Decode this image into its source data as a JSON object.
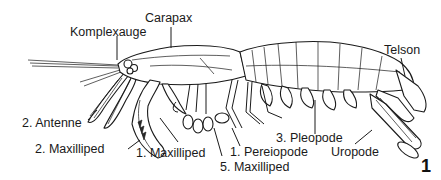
{
  "diagram": {
    "figure_number": "1",
    "labels": {
      "carapax": "Carapax",
      "komplexauge": "Komplexauge",
      "telson": "Telson",
      "antenne2": "2. Antenne",
      "maxilliped2": "2. Maxilliped",
      "maxilliped1": "1. Maxilliped",
      "maxilliped5": "5. Maxilliped",
      "pereiopode1": "1. Pereiopode",
      "pleopode3": "3. Pleopode",
      "uropode": "Uropode"
    },
    "line_color": "#1a1a1a",
    "background": "#ffffff"
  }
}
